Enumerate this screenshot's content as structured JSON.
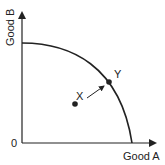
{
  "diagram": {
    "type": "production-possibilities-frontier",
    "x_axis_label": "Good A",
    "y_axis_label": "Good B",
    "origin_label": "0",
    "points": [
      {
        "label": "X",
        "position": "inside frontier"
      },
      {
        "label": "Y",
        "position": "on frontier"
      }
    ],
    "arrow": {
      "from": "X",
      "to": "Y"
    },
    "colors": {
      "line": "#222222",
      "background": "#ffffff"
    }
  }
}
